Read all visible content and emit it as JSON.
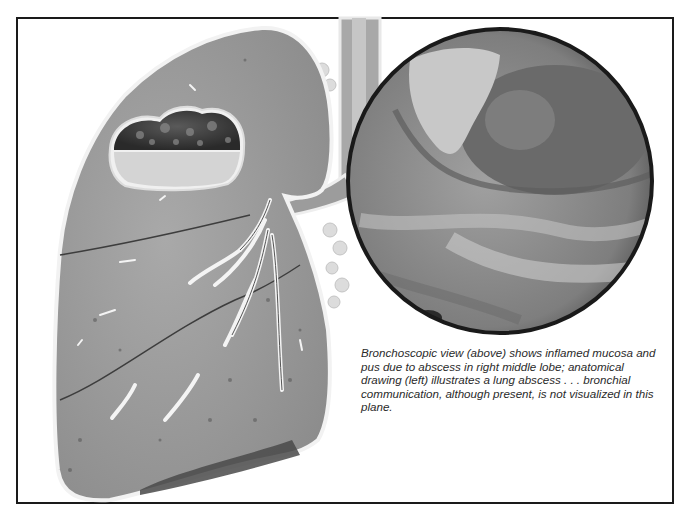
{
  "figure": {
    "caption": "Bronchoscopic view (above) shows inflamed mucosa and pus due to abscess in right middle lobe; anatomical drawing (left) illustrates a lung abscess . . . bronchial communication, although present, is not visualized in this plane.",
    "panels": [
      {
        "id": "anatomical-drawing",
        "subject": "right lung cross-section with abscess cavity in upper region"
      },
      {
        "id": "bronchoscopic-view",
        "subject": "circular endoscopic photo of inflamed mucosa and pus"
      }
    ],
    "colors": {
      "border": "#1a1a1a",
      "lung_tissue": "#9a9a9a",
      "cavity_dark": "#3a3a3a",
      "pus_fluid": "#d8d8d8",
      "scope_dark": "#6e6e6e",
      "scope_light": "#bdbdbd"
    }
  }
}
